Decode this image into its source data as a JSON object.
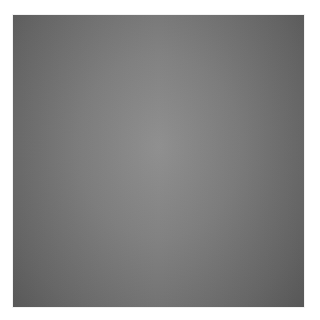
{
  "image": {
    "description": "Gray square with soft radial gradient on white background",
    "colors": {
      "background": "#ffffff",
      "center": "#8c8c8c",
      "edge": "#5e5e5e"
    }
  }
}
